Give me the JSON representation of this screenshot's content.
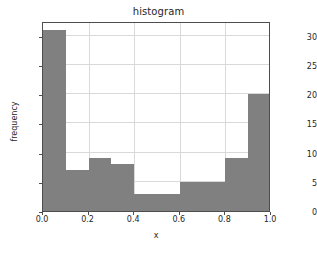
{
  "chart_data": {
    "type": "bar",
    "title": "histogram",
    "xlabel": "x",
    "ylabel": "frequency",
    "categories": [
      "0.0-0.1",
      "0.1-0.2",
      "0.2-0.3",
      "0.3-0.4",
      "0.4-0.5",
      "0.5-0.6",
      "0.6-0.7",
      "0.7-0.8",
      "0.8-0.9",
      "0.9-1.0"
    ],
    "bin_edges": [
      0.0,
      0.1,
      0.2,
      0.3,
      0.4,
      0.5,
      0.6,
      0.7,
      0.8,
      0.9,
      1.0
    ],
    "values": [
      31,
      7,
      9,
      8,
      3,
      3,
      5,
      5,
      9,
      20
    ],
    "xlim": [
      0.0,
      1.0
    ],
    "ylim": [
      0,
      32.55
    ],
    "xticks": [
      0.0,
      0.2,
      0.4,
      0.6,
      0.8,
      1.0
    ],
    "xtick_labels": [
      "0.0",
      "0.2",
      "0.4",
      "0.6",
      "0.8",
      "1.0"
    ],
    "yticks": [
      0,
      5,
      10,
      15,
      20,
      25,
      30
    ],
    "ytick_labels": [
      "0",
      "5",
      "10",
      "15",
      "20",
      "25",
      "30"
    ],
    "grid": true,
    "legend": null,
    "bar_color": "#808080",
    "grid_color": "#d9d9d9",
    "axis_color": "#4d4d4d"
  }
}
